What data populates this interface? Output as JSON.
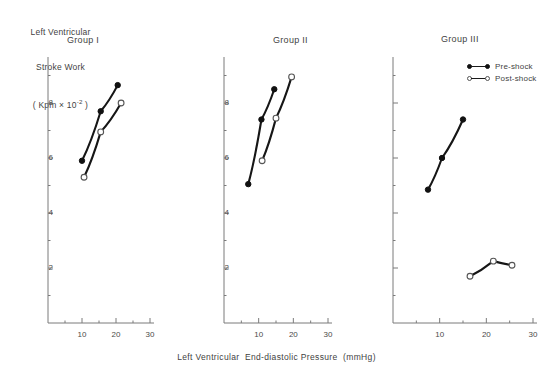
{
  "axis_titles": {
    "y_line1": "Left Ventricular",
    "y_line2": "Stroke Work",
    "y_line3_prefix": "( Kpm × 10",
    "y_line3_exp": "-2",
    "y_line3_suffix": " )",
    "x": "Left Ventricular  End-diastolic Pressure  (mmHg)"
  },
  "legend": {
    "position": "top-right",
    "items": [
      {
        "label": "Pre-shock",
        "marker": "filled-circle",
        "color": "#111111"
      },
      {
        "label": "Post-shock",
        "marker": "open-circle",
        "color": "#555555"
      }
    ]
  },
  "panels": [
    {
      "title": "Group I"
    },
    {
      "title": "Group II"
    },
    {
      "title": "Group III"
    }
  ],
  "ticks": {
    "y": [
      "2",
      "4",
      "6",
      "8"
    ],
    "x": [
      "10",
      "20",
      "30"
    ]
  },
  "chart_data": [
    {
      "type": "line",
      "title": "Group I",
      "xlabel": "Left Ventricular End-diastolic Pressure (mmHg)",
      "ylabel": "Left Ventricular Stroke Work (Kpm x 10^-2)",
      "xlim": [
        0,
        32
      ],
      "ylim": [
        0,
        9.6
      ],
      "grid": false,
      "series": [
        {
          "name": "Pre-shock",
          "marker": "filled-circle",
          "x": [
            10.0,
            15.5,
            20.5
          ],
          "y": [
            5.9,
            7.7,
            8.65
          ]
        },
        {
          "name": "Post-shock",
          "marker": "open-circle",
          "x": [
            10.6,
            15.5,
            21.5
          ],
          "y": [
            5.3,
            6.95,
            8.0
          ]
        }
      ]
    },
    {
      "type": "line",
      "title": "Group II",
      "xlabel": "Left Ventricular End-diastolic Pressure (mmHg)",
      "ylabel": "Left Ventricular Stroke Work (Kpm x 10^-2)",
      "xlim": [
        0,
        32
      ],
      "ylim": [
        0,
        9.6
      ],
      "grid": false,
      "series": [
        {
          "name": "Pre-shock",
          "marker": "filled-circle",
          "x": [
            7.0,
            10.8,
            14.5
          ],
          "y": [
            5.05,
            7.4,
            8.5
          ]
        },
        {
          "name": "Post-shock",
          "marker": "open-circle",
          "x": [
            11.0,
            15.0,
            19.5
          ],
          "y": [
            5.9,
            7.45,
            8.95
          ]
        }
      ]
    },
    {
      "type": "line",
      "title": "Group III",
      "xlabel": "Left Ventricular End-diastolic Pressure (mmHg)",
      "ylabel": "Left Ventricular Stroke Work (Kpm x 10^-2)",
      "xlim": [
        0,
        32
      ],
      "ylim": [
        0,
        9.6
      ],
      "grid": false,
      "series": [
        {
          "name": "Pre-shock",
          "marker": "filled-circle",
          "x": [
            7.5,
            10.5,
            15.0
          ],
          "y": [
            4.85,
            6.0,
            7.4
          ]
        },
        {
          "name": "Post-shock",
          "marker": "open-circle",
          "x": [
            16.5,
            21.5,
            25.5
          ],
          "y": [
            1.7,
            2.25,
            2.1
          ]
        }
      ]
    }
  ]
}
